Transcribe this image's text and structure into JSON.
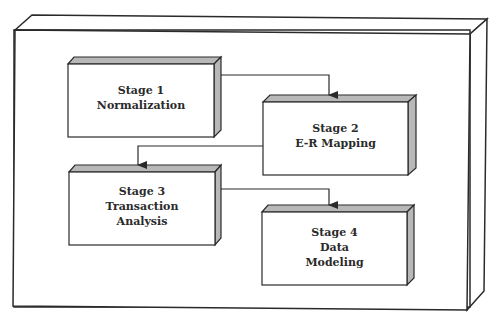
{
  "diagram": {
    "colors": {
      "stroke": "#2a2a2a",
      "face": "#ffffff",
      "shade": "#b8b8b8"
    },
    "stages": [
      {
        "id": "stage1",
        "title": "Stage 1",
        "lines": [
          "Normalization"
        ]
      },
      {
        "id": "stage2",
        "title": "Stage 2",
        "lines": [
          "E-R Mapping"
        ]
      },
      {
        "id": "stage3",
        "title": "Stage 3",
        "lines": [
          "Transaction",
          "Analysis"
        ]
      },
      {
        "id": "stage4",
        "title": "Stage 4",
        "lines": [
          "Data",
          "Modeling"
        ]
      }
    ],
    "connectors": [
      {
        "from": "Stage 1",
        "to": "Stage 2"
      },
      {
        "from": "Stage 2",
        "to": "Stage 3"
      },
      {
        "from": "Stage 3",
        "to": "Stage 4"
      }
    ]
  }
}
